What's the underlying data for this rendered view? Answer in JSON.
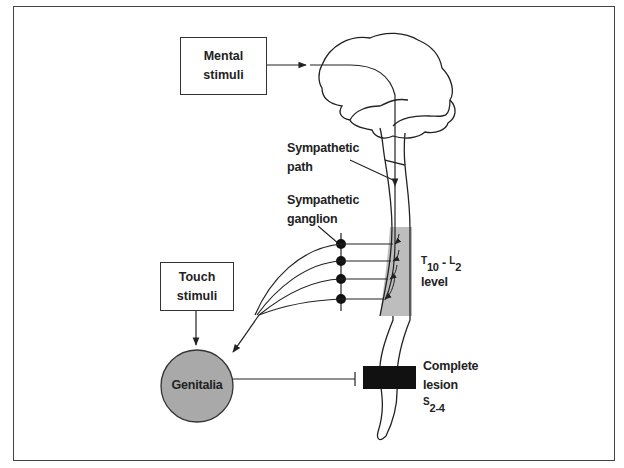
{
  "diagram": {
    "type": "neuro-physiology flow diagram",
    "nodes": {
      "mental_stimuli": {
        "line1": "Mental",
        "line2": "stimuli"
      },
      "touch_stimuli": {
        "line1": "Touch",
        "line2": "stimuli"
      },
      "genitalia": {
        "label": "Genitalia"
      },
      "brain": {
        "label": ""
      },
      "spinal_cord": {
        "label": ""
      }
    },
    "labels": {
      "sympathetic_path": {
        "line1": "Sympathetic",
        "line2": "path"
      },
      "sympathetic_ganglion": {
        "line1": "Sympathetic",
        "line2": "ganglion"
      },
      "level": {
        "t": "T",
        "t_sub": "10",
        "dash": " - ",
        "l": "L",
        "l_sub": "2",
        "line2": "level"
      },
      "lesion": {
        "line1": "Complete",
        "line2": "lesion",
        "s": "S",
        "s_sub": "2-4"
      }
    },
    "colors": {
      "line": "#222222",
      "shaded_region": "#bdbdbd",
      "genitalia_fill": "#a9a9a9",
      "lesion_fill": "#111111",
      "frame": "#444444"
    },
    "edges": [
      {
        "from": "Mental stimuli",
        "to": "Brain",
        "type": "arrow"
      },
      {
        "from": "Brain",
        "to": "Spinal cord T10-L2",
        "type": "arrow",
        "label": "Sympathetic path"
      },
      {
        "from": "Spinal cord T10-L2",
        "to": "Sympathetic ganglion",
        "type": "arrows x4"
      },
      {
        "from": "Sympathetic ganglion",
        "to": "Genitalia",
        "type": "arrow"
      },
      {
        "from": "Touch stimuli",
        "to": "Genitalia",
        "type": "arrow"
      },
      {
        "from": "Genitalia",
        "to": "Complete lesion S2-4",
        "type": "blocked (inhibitory bar)"
      }
    ]
  }
}
